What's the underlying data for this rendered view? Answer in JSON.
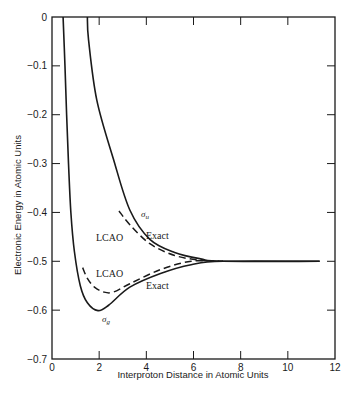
{
  "chart_data": {
    "type": "line",
    "title": "",
    "xlabel": "Interproton Distance in Atomic Units",
    "ylabel": "Electronic Energy in Atomic Units",
    "xlim": [
      0,
      12
    ],
    "ylim": [
      -0.7,
      0
    ],
    "xticks": [
      0,
      2,
      4,
      6,
      8,
      10,
      12
    ],
    "xtick_labels": [
      "0",
      "2",
      "4",
      "6",
      "8",
      "10",
      "12"
    ],
    "yticks": [
      0,
      -0.1,
      -0.2,
      -0.3,
      -0.4,
      -0.5,
      -0.6,
      -0.7
    ],
    "ytick_labels": [
      "0",
      "-0.1",
      "-0.2",
      "-0.3",
      "-0.4",
      "-0.5",
      "-0.6",
      "-0.7"
    ],
    "grid": false,
    "legend": "none (inline annotations)",
    "series": [
      {
        "name": "σg Exact",
        "style": "solid",
        "x": [
          0.47,
          0.55,
          0.62,
          0.7,
          0.8,
          0.95,
          1.2,
          1.5,
          1.95,
          2.4,
          3.3,
          4.6,
          5.9,
          7.25,
          11.35
        ],
        "y": [
          0.0,
          -0.1,
          -0.2,
          -0.3,
          -0.4,
          -0.48,
          -0.55,
          -0.585,
          -0.601,
          -0.59,
          -0.553,
          -0.525,
          -0.507,
          -0.5,
          -0.5
        ]
      },
      {
        "name": "σg LCAO",
        "style": "dashed",
        "x": [
          1.3,
          1.5,
          1.8,
          2.2,
          2.6,
          3.3,
          4.6,
          5.9,
          7.25
        ],
        "y": [
          -0.513,
          -0.535,
          -0.553,
          -0.563,
          -0.563,
          -0.546,
          -0.517,
          -0.5,
          -0.5
        ]
      },
      {
        "name": "σu Exact",
        "style": "solid",
        "x": [
          1.5,
          1.55,
          1.9,
          2.6,
          3.3,
          4.15,
          5.2,
          6.3,
          7.25,
          11.35
        ],
        "y": [
          0.0,
          -0.047,
          -0.17,
          -0.29,
          -0.395,
          -0.455,
          -0.482,
          -0.495,
          -0.5,
          -0.5
        ]
      },
      {
        "name": "σu LCAO",
        "style": "dashed",
        "x": [
          2.84,
          3.3,
          4.15,
          5.2,
          6.3,
          7.25
        ],
        "y": [
          -0.397,
          -0.425,
          -0.464,
          -0.488,
          -0.498,
          -0.5
        ]
      }
    ],
    "annotations": [
      {
        "text": "σu",
        "x": 3.95,
        "y": -0.405
      },
      {
        "text": "LCAO",
        "x": 2.5,
        "y": -0.45
      },
      {
        "text": "Exact",
        "x": 4.5,
        "y": -0.448
      },
      {
        "text": "LCAO",
        "x": 2.55,
        "y": -0.523
      },
      {
        "text": "Exact",
        "x": 4.5,
        "y": -0.548
      },
      {
        "text": "σg",
        "x": 2.3,
        "y": -0.62
      }
    ]
  },
  "labels": {
    "xlabel": "Interproton Distance in Atomic Units",
    "ylabel": "Electronic Energy in Atomic Units",
    "sigma_u_base": "σ",
    "sigma_u_sub": "u",
    "sigma_g_base": "σ",
    "sigma_g_sub": "g",
    "lcao_upper": "LCAO",
    "exact_upper": "Exact",
    "lcao_lower": "LCAO",
    "exact_lower": "Exact"
  },
  "colors": {
    "ink": "#1a1a1a",
    "background": "#ffffff"
  }
}
